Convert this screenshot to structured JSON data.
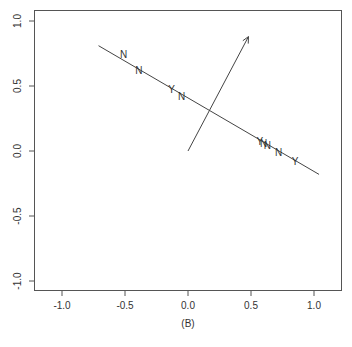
{
  "chart_data": {
    "type": "scatter",
    "title": "",
    "caption": "(B)",
    "xlabel": "",
    "ylabel": "",
    "xlim": [
      -1.2,
      1.22
    ],
    "ylim": [
      -1.08,
      1.08
    ],
    "grid": false,
    "legend": null,
    "x_ticks": [
      -1.0,
      -0.5,
      0.0,
      0.5,
      1.0
    ],
    "x_tick_labels": [
      "-1.0",
      "-0.5",
      "0.0",
      "0.5",
      "1.0"
    ],
    "y_ticks": [
      -1.0,
      -0.5,
      0.0,
      0.5,
      1.0
    ],
    "y_tick_labels": [
      "-1.0",
      "-0.5",
      "0.0",
      "0.5",
      "1.0"
    ],
    "points": [
      {
        "label": "N",
        "x": -0.51,
        "y": 0.75
      },
      {
        "label": "N",
        "x": -0.39,
        "y": 0.62
      },
      {
        "label": "Y",
        "x": -0.13,
        "y": 0.48
      },
      {
        "label": "N",
        "x": -0.05,
        "y": 0.42
      },
      {
        "label": "Y",
        "x": 0.57,
        "y": 0.08
      },
      {
        "label": "N",
        "x": 0.6,
        "y": 0.06
      },
      {
        "label": "N",
        "x": 0.63,
        "y": 0.05
      },
      {
        "label": "N",
        "x": 0.72,
        "y": -0.01
      },
      {
        "label": "Y",
        "x": 0.85,
        "y": -0.08
      }
    ],
    "line": {
      "x1": -0.71,
      "y1": 0.81,
      "x2": 1.04,
      "y2": -0.18
    },
    "arrow": {
      "x1": 0.0,
      "y1": 0.0,
      "x2": 0.48,
      "y2": 0.88
    },
    "colors": {
      "axis": "#555555",
      "line": "#444444",
      "text": "#333333"
    }
  }
}
